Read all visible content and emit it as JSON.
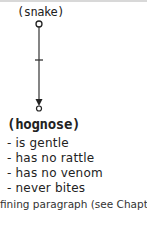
{
  "diagram": {
    "root": {
      "label": "(snake)"
    },
    "edge": {
      "label": "T"
    },
    "child": {
      "label": "(hognose)",
      "attributes": [
        "- is gentle",
        "- has no rattle",
        "- has no venom",
        "- never bites"
      ]
    }
  },
  "caption": "fining paragraph (see Chapter 2)"
}
